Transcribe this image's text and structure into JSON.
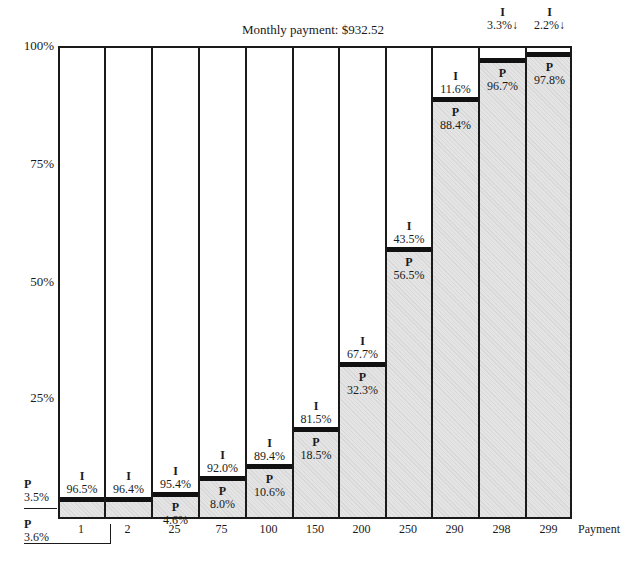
{
  "chart_data": {
    "type": "bar",
    "stacked": true,
    "title": "Monthly payment: $932.52",
    "xlabel": "Payment",
    "ylabel": "",
    "ylim": [
      0,
      100
    ],
    "yticks": [
      "100%",
      "75%",
      "50%",
      "25%"
    ],
    "categories": [
      "1",
      "2",
      "25",
      "75",
      "100",
      "150",
      "200",
      "250",
      "290",
      "298",
      "299"
    ],
    "series": [
      {
        "name": "P",
        "label": "Principal",
        "values": [
          3.5,
          3.6,
          4.6,
          8.0,
          10.6,
          18.5,
          32.3,
          56.5,
          88.4,
          96.7,
          97.8
        ]
      },
      {
        "name": "I",
        "label": "Interest",
        "values": [
          96.5,
          96.4,
          95.4,
          92.0,
          89.4,
          81.5,
          67.7,
          43.5,
          11.6,
          3.3,
          2.2
        ]
      }
    ],
    "labels": {
      "p": [
        "3.5%",
        "3.6%",
        "4.6%",
        "8.0%",
        "10.6%",
        "18.5%",
        "32.3%",
        "56.5%",
        "88.4%",
        "96.7%",
        "97.8%"
      ],
      "i": [
        "96.5%",
        "96.4%",
        "95.4%",
        "92.0%",
        "89.4%",
        "81.5%",
        "67.7%",
        "43.5%",
        "11.6%",
        "3.3%",
        "2.2%"
      ]
    },
    "series_letters": {
      "p": "P",
      "i": "I"
    },
    "grid": false,
    "legend": "none"
  }
}
